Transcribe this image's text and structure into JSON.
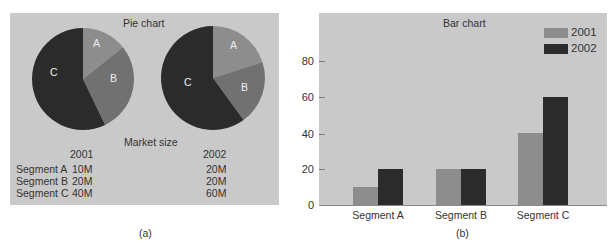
{
  "colors": {
    "panel_bg": "#c9c9c9",
    "slice_a": "#8d8d8d",
    "slice_b": "#717171",
    "slice_c": "#2b2b2b",
    "series_2001": "#8d8d8d",
    "series_2002": "#2b2b2b"
  },
  "panel_a": {
    "title": "Pie chart",
    "pie_labels": [
      "A",
      "B",
      "C"
    ],
    "table_title": "Market size",
    "years": [
      "2001",
      "2002"
    ],
    "rows": [
      {
        "label": "Segment A",
        "v2001": "10M",
        "v2002": "20M"
      },
      {
        "label": "Segment B",
        "v2001": "20M",
        "v2002": "20M"
      },
      {
        "label": "Segment C",
        "v2001": "40M",
        "v2002": "60M"
      }
    ],
    "caption": "(a)"
  },
  "panel_b": {
    "title": "Bar chart",
    "y_ticks": [
      "80",
      "60",
      "40",
      "20",
      "0"
    ],
    "categories": [
      "Segment A",
      "Segment B",
      "Segment C"
    ],
    "legend": [
      "2001",
      "2002"
    ],
    "caption": "(b)"
  },
  "chart_data": [
    {
      "type": "pie",
      "title": "Pie chart",
      "subtitle": "2001",
      "categories": [
        "A",
        "B",
        "C"
      ],
      "values": [
        10,
        20,
        40
      ],
      "units": "M"
    },
    {
      "type": "pie",
      "title": "Pie chart",
      "subtitle": "2002",
      "categories": [
        "A",
        "B",
        "C"
      ],
      "values": [
        20,
        20,
        60
      ],
      "units": "M"
    },
    {
      "type": "table",
      "title": "Market size",
      "columns": [
        "",
        "2001",
        "2002"
      ],
      "rows": [
        [
          "Segment A",
          "10M",
          "20M"
        ],
        [
          "Segment B",
          "20M",
          "20M"
        ],
        [
          "Segment C",
          "40M",
          "60M"
        ]
      ]
    },
    {
      "type": "bar",
      "title": "Bar chart",
      "categories": [
        "Segment A",
        "Segment B",
        "Segment C"
      ],
      "series": [
        {
          "name": "2001",
          "values": [
            10,
            20,
            40
          ]
        },
        {
          "name": "2002",
          "values": [
            20,
            20,
            60
          ]
        }
      ],
      "xlabel": "",
      "ylabel": "",
      "ylim": [
        0,
        90
      ],
      "yticks": [
        0,
        20,
        40,
        60,
        80
      ],
      "grid": false,
      "legend_position": "top-right"
    }
  ]
}
